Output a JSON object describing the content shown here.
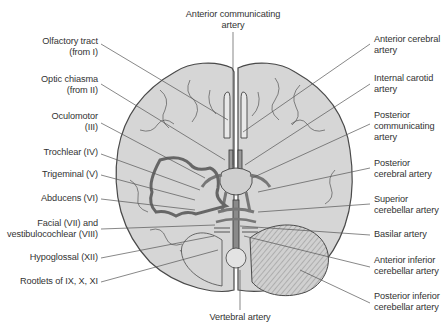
{
  "figure": {
    "colors": {
      "brain_fill": "#d6d6d6",
      "brain_outline": "#4a4a4a",
      "vessel_fill": "#9a9a9a",
      "leader_line": "#555555",
      "text": "#333333"
    },
    "top_label": {
      "lines": [
        "Anterior communicating",
        "artery"
      ]
    },
    "bottom_label": {
      "lines": [
        "Vertebral artery"
      ]
    },
    "left_labels": [
      {
        "lines": [
          "Olfactory tract",
          "(from I)"
        ]
      },
      {
        "lines": [
          "Optic chiasma",
          "(from II)"
        ]
      },
      {
        "lines": [
          "Oculomotor",
          "(III)"
        ]
      },
      {
        "lines": [
          "Trochlear (IV)"
        ]
      },
      {
        "lines": [
          "Trigeminal (V)"
        ]
      },
      {
        "lines": [
          "Abducens (VI)"
        ]
      },
      {
        "lines": [
          "Facial (VII) and",
          "vestibulocochlear (VIII)"
        ]
      },
      {
        "lines": [
          "Hypoglossal (XII)"
        ]
      },
      {
        "lines": [
          "Rootlets of IX, X, XI"
        ]
      }
    ],
    "right_labels": [
      {
        "lines": [
          "Anterior cerebral",
          "artery"
        ]
      },
      {
        "lines": [
          "Internal carotid",
          "artery"
        ]
      },
      {
        "lines": [
          "Posterior",
          "communicating",
          "artery"
        ]
      },
      {
        "lines": [
          "Posterior",
          "cerebral artery"
        ]
      },
      {
        "lines": [
          "Superior",
          "cerebellar artery"
        ]
      },
      {
        "lines": [
          "Basilar artery"
        ]
      },
      {
        "lines": [
          "Anterior inferior",
          "cerebellar artery"
        ]
      },
      {
        "lines": [
          "Posterior inferior",
          "cerebellar artery"
        ]
      }
    ]
  }
}
